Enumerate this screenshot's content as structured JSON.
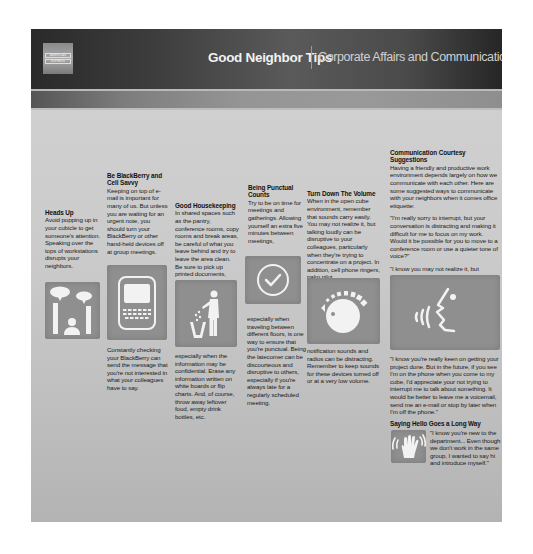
{
  "header": {
    "logo_lines": [
      "AMERICAN",
      "EXPRESS"
    ],
    "title": "Good Neighbor Tips",
    "subtitle": "Corporate Affairs and Communications"
  },
  "tips": [
    {
      "heading": "Heads Up",
      "text_before": "Avoid popping up in your cubicle to get someone's attention. Speaking over the tops of workstations disrupts your neighbors.",
      "icon": "speech-bubbles-person-icon"
    },
    {
      "heading": "Be BlackBerry and Cell Savvy",
      "text_before": "Keeping on top of e-mail is important for many of us. But unless you are waiting for an urgent note, you should turn your BlackBerry or other hand-held devices off at group meetings.",
      "text_after": "Constantly checking your BlackBerry can send the message that you're not interested in what your colleagues have to say.",
      "icon": "blackberry-phone-icon"
    },
    {
      "heading": "Good Housekeeping",
      "text_before": "In shared spaces such as the pantry, conference rooms, copy rooms and break areas, be careful of what you leave behind and try to leave the area clean. Be sure to pick up printed documents,",
      "text_after": "especially when the information may be confidential. Erase any information written on white boards or flip charts. And, of course, throw away leftover food, empty drink bottles, etc.",
      "icon": "trash-bin-person-icon"
    },
    {
      "heading": "Being Punctual Counts",
      "text_before": "Try to be on time for meetings and gatherings. Allowing yourself an extra five minutes between meetings,",
      "text_after": "especially when traveling between different floors, is one way to ensure that you're punctual. Being the latecomer can be discourteous and disruptive to others, especially if you're always late for a regularly scheduled meeting.",
      "icon": "checkmark-circle-icon"
    },
    {
      "heading": "Turn Down The Volume",
      "text_before": "When in the open cube environment, remember that sounds carry easily. You may not realize it, but talking loudly can be disruptive to your colleagues, particularly when they're trying to concentrate on a project. In addition, cell phone ringers, palm pilot",
      "text_after": "notification sounds and radios can be distracting. Remember to keep sounds for these devices turned off or at a very low volume.",
      "icon": "volume-knob-icon"
    },
    {
      "heading": "Communication Courtesy Suggestions",
      "text_before": "Having a friendly and productive work environment depends largely on how we communicate with each other. Here are some suggested ways to communicate with your neighbors when it comes office etiquette:",
      "quotes": [
        "\"I'm really sorry to interrupt, but your conversation is distracting and making it difficult for me to focus on my work. Would it be possible for you to move to a conference room or use a quieter tone of voice?\"",
        "\"I know you may not realize it, but sometimes your voice is a bit loud. I'd really appreciate it if you could lower your voice a bit.\""
      ],
      "text_after": "\"I know you're really keen on getting your project done. But in the future, if you see I'm on the phone when you come to my cube, I'd appreciate your not trying to interrupt me to talk about something. It would be better to leave me a voicemail, send me an e-mail or stop by later when I'm off the phone.\"",
      "icon": "speaking-face-icon"
    },
    {
      "heading": "Saying Hello Goes a Long Way",
      "text_before": "\"I know you're new to the department... Even though we don't work in the same group, I wanted to say hi and introduce myself.\"",
      "icon": "waving-hand-icon"
    }
  ]
}
